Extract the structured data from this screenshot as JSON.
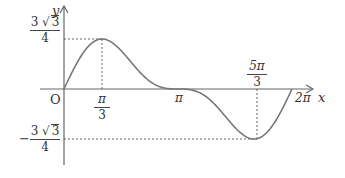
{
  "chart_data": {
    "type": "line",
    "title": "",
    "function": "y = sin x + (1/2) sin 2x",
    "xlabel": "x",
    "ylabel": "y",
    "origin_label": "O",
    "x_range": [
      0,
      6.2832
    ],
    "y_range": [
      -1.299,
      1.299
    ],
    "grid": false,
    "x_ticks": [
      {
        "value": 1.0472,
        "label": "π/3",
        "num": "π",
        "den": "3"
      },
      {
        "value": 3.1416,
        "label": "π"
      },
      {
        "value": 5.236,
        "label": "5π/3",
        "num": "5π",
        "den": "3"
      },
      {
        "value": 6.2832,
        "label": "2π"
      }
    ],
    "y_ticks": [
      {
        "value": 1.299,
        "label": "3√3/4",
        "num_coef": "3",
        "num_rad": "3",
        "den": "4"
      },
      {
        "value": -1.299,
        "label": "-3√3/4",
        "sign": "−",
        "num_coef": "3",
        "num_rad": "3",
        "den": "4"
      }
    ],
    "key_points": [
      {
        "x": 0,
        "y": 0
      },
      {
        "x": 1.0472,
        "y": 1.299,
        "note": "maximum"
      },
      {
        "x": 3.1416,
        "y": 0
      },
      {
        "x": 5.236,
        "y": -1.299,
        "note": "minimum"
      },
      {
        "x": 6.2832,
        "y": 0
      }
    ],
    "colors": {
      "curve": "#777777",
      "axis": "#666666",
      "guide": "#555555"
    }
  }
}
